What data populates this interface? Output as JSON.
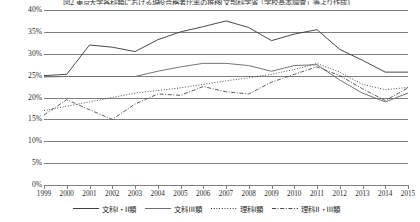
{
  "chart_data": {
    "type": "line",
    "title": "図2 東京大学各科類における現役合格者比率の推移(文部科学省「学校基本調査」等より作成)",
    "xlabel": "",
    "ylabel": "",
    "x": [
      1999,
      2000,
      2001,
      2002,
      2003,
      2004,
      2005,
      2006,
      2007,
      2008,
      2009,
      2010,
      2011,
      2012,
      2013,
      2014,
      2015
    ],
    "categories": [
      "1999",
      "2000",
      "2001",
      "2002",
      "2003",
      "2004",
      "2005",
      "2006",
      "2007",
      "2008",
      "2009",
      "2010",
      "2011",
      "2012",
      "2013",
      "2014",
      "2015"
    ],
    "ylim": [
      0,
      40
    ],
    "yticks": [
      0,
      5,
      10,
      15,
      20,
      25,
      30,
      35,
      40
    ],
    "ytick_labels": [
      "0%",
      "5%",
      "10%",
      "15%",
      "20%",
      "25%",
      "30%",
      "35%",
      "40%"
    ],
    "grid": true,
    "legend_position": "bottom",
    "series": [
      {
        "name": "文科I・II類",
        "style": "solid",
        "color": "#404040",
        "values": [
          25.0,
          25.3,
          32.0,
          31.5,
          30.5,
          33.2,
          35.0,
          36.2,
          37.5,
          36.0,
          33.0,
          34.5,
          35.5,
          31.0,
          28.5,
          25.8,
          25.8
        ]
      },
      {
        "name": "文科III類",
        "style": "solid",
        "color": "#6e6e6e",
        "values": [
          24.7,
          24.8,
          24.8,
          24.8,
          24.8,
          26.0,
          27.0,
          27.8,
          27.8,
          27.3,
          26.0,
          27.3,
          27.5,
          24.0,
          21.0,
          19.0,
          21.0
        ]
      },
      {
        "name": "理科I類",
        "style": "dotted",
        "color": "#3a3a3a",
        "values": [
          17.0,
          18.0,
          19.0,
          20.0,
          21.0,
          21.6,
          22.2,
          23.0,
          23.8,
          24.5,
          25.3,
          26.4,
          27.8,
          25.8,
          23.0,
          21.8,
          22.3
        ]
      },
      {
        "name": "理科II・III類",
        "style": "dashdot",
        "color": "#4a4a4a",
        "values": [
          16.0,
          19.5,
          17.2,
          15.0,
          18.5,
          20.8,
          20.5,
          22.5,
          21.3,
          20.8,
          23.5,
          25.3,
          27.0,
          25.0,
          22.0,
          19.3,
          22.2
        ]
      }
    ]
  },
  "legend": {
    "items": [
      {
        "label": "文科I・II類",
        "style": "solid"
      },
      {
        "label": "文科III類",
        "style": "solid"
      },
      {
        "label": "理科I類",
        "style": "dotted"
      },
      {
        "label": "理科II・III類",
        "style": "dashdot"
      }
    ]
  }
}
